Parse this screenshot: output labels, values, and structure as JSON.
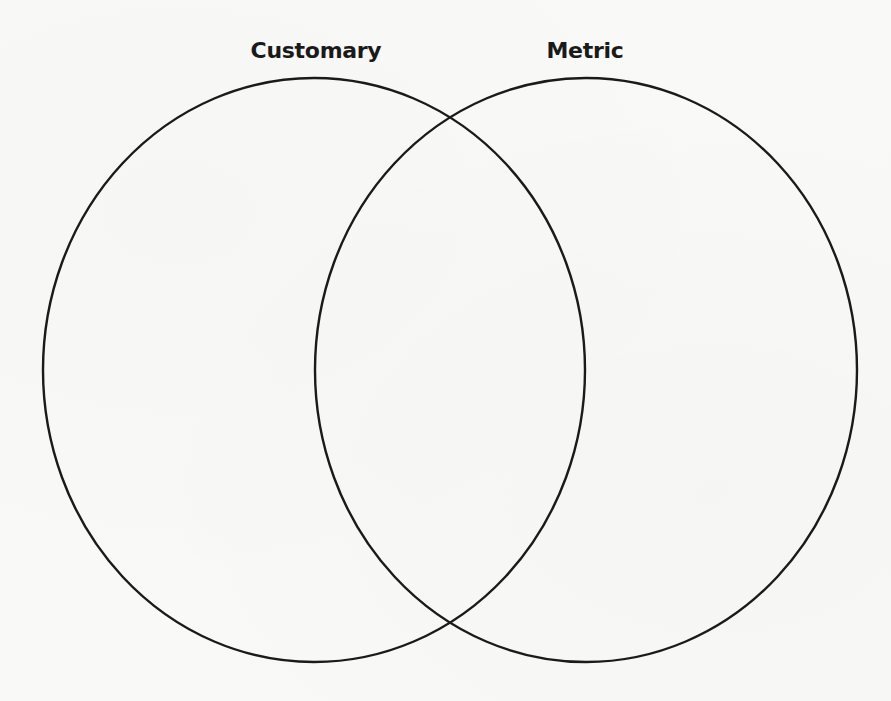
{
  "diagram": {
    "type": "venn",
    "stroke_color": "#1a1a1a",
    "background_color": "#f9f9f8",
    "sets": [
      {
        "label": "Customary",
        "label_center_x": 316,
        "ellipse": {
          "cx": 314,
          "cy": 370,
          "rx": 271,
          "ry": 292
        }
      },
      {
        "label": "Metric",
        "label_center_x": 585,
        "ellipse": {
          "cx": 586,
          "cy": 370,
          "rx": 271,
          "ry": 292
        }
      }
    ],
    "regions": {
      "customary_only": "",
      "intersection": "",
      "metric_only": ""
    }
  }
}
